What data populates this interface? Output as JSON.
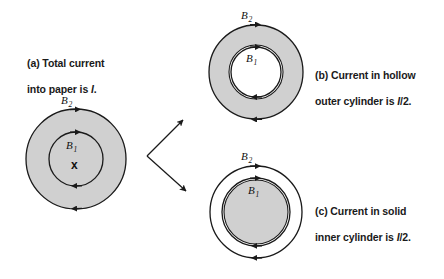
{
  "figure": {
    "background_color": "#ffffff",
    "conductor_fill": "#d0d0d0",
    "line_color": "#1a1a1a",
    "hollow_fill": "#ffffff"
  },
  "panels": [
    {
      "id": "a",
      "caption_line1": "(a) Total current",
      "caption_line2_pre": "into paper is ",
      "caption_line2_italic": "I",
      "caption_line2_post": ".",
      "caption_full": "(a) Total current into paper is I.",
      "center": {
        "x": 76,
        "y": 159
      },
      "conductor": {
        "type": "solid-disk",
        "radius": 50,
        "fill": "#d0d0d0"
      },
      "field_circles": [
        {
          "label": "B",
          "subscript": "1",
          "radius": 27,
          "direction": "clockwise"
        },
        {
          "label": "B",
          "subscript": "2",
          "radius": 50,
          "direction": "clockwise"
        }
      ],
      "current_symbol": "x",
      "current_direction": "into-page"
    },
    {
      "id": "b",
      "caption_line1": "(b) Current in hollow",
      "caption_line2_pre": "outer cylinder is ",
      "caption_line2_italic": "I",
      "caption_line2_post": "/2.",
      "caption_full": "(b) Current in hollow outer cylinder is I/2.",
      "center": {
        "x": 256,
        "y": 72
      },
      "conductor": {
        "type": "annulus",
        "outer_radius": 47,
        "inner_radius": 27,
        "fill": "#d0d0d0",
        "hole_fill": "#ffffff"
      },
      "field_circles": [
        {
          "label": "B",
          "subscript": "1",
          "radius": 25,
          "direction": "clockwise"
        },
        {
          "label": "B",
          "subscript": "2",
          "radius": 47,
          "direction": "clockwise"
        }
      ]
    },
    {
      "id": "c",
      "caption_line1": "(c) Current in solid",
      "caption_line2_pre": "inner cylinder is ",
      "caption_line2_italic": "I",
      "caption_line2_post": "/2.",
      "caption_full": "(c) Current in solid inner cylinder is I/2.",
      "center": {
        "x": 256,
        "y": 212
      },
      "conductor": {
        "type": "solid-disk",
        "radius": 32,
        "fill": "#d0d0d0"
      },
      "field_circles": [
        {
          "label": "B",
          "subscript": "1",
          "radius": 34,
          "direction": "clockwise"
        },
        {
          "label": "B",
          "subscript": "2",
          "radius": 46,
          "direction": "clockwise"
        }
      ]
    }
  ],
  "connectors": [
    {
      "id": "arrow-to-b",
      "from": {
        "x": 147,
        "y": 156
      },
      "to": {
        "x": 186,
        "y": 117
      }
    },
    {
      "id": "arrow-to-c",
      "from": {
        "x": 147,
        "y": 156
      },
      "to": {
        "x": 189,
        "y": 194
      }
    }
  ],
  "labels": {
    "b1": "B",
    "b1_sub": "1",
    "b2": "B",
    "b2_sub": "2",
    "into_page_symbol": "x"
  }
}
